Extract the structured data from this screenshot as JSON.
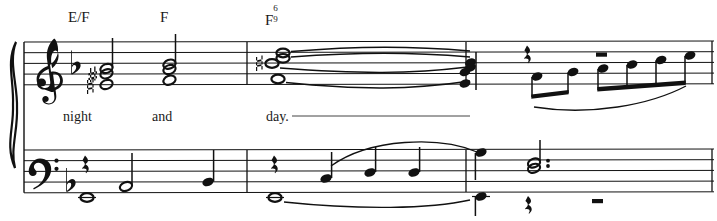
{
  "page": {
    "width": 717,
    "height": 221,
    "background_color": "#ffffff",
    "ink_color": "#111111"
  },
  "score": {
    "system": "grand-staff",
    "instrument": "piano with vocal line",
    "key_signature": "1 flat (F major / D minor)",
    "staves": [
      {
        "name": "treble",
        "clef": "treble-clef",
        "top": 42,
        "line_gap": 10.7
      },
      {
        "name": "bass",
        "clef": "bass-clef",
        "top": 150,
        "line_gap": 10.7
      }
    ],
    "barlines": [
      247,
      466,
      712
    ],
    "measures": 3
  },
  "chords": [
    {
      "root": "E",
      "bass": "F",
      "label": "E/F",
      "x": 68,
      "y": 10
    },
    {
      "root": "F",
      "bass": "",
      "label": "F",
      "x": 160,
      "y": 10
    },
    {
      "root": "F",
      "bass": "",
      "label": "F",
      "extension_top": "6",
      "extension_bottom": "9",
      "x": 265,
      "y": 10
    }
  ],
  "lyrics": [
    {
      "text": "night",
      "x": 63,
      "y": 110,
      "extender": false
    },
    {
      "text": "and",
      "x": 152,
      "y": 110,
      "extender": false
    },
    {
      "text": "day.",
      "x": 266,
      "y": 110,
      "extender": true,
      "extender_to": 470
    }
  ],
  "notation": {
    "treble": {
      "measure_1": {
        "description": "half-note chord with sharp and natural accidentals, stem up",
        "noteheads": [
          "half",
          "half",
          "half"
        ],
        "accidentals": [
          "sharp",
          "natural"
        ]
      },
      "measure_2": {
        "description": "half-note chord, stem up",
        "noteheads": [
          "half",
          "half",
          "half"
        ]
      },
      "measure_3": {
        "description": "whole-note chord with natural accidental, tied across the barline to quarter-note chord",
        "noteheads": [
          "whole",
          "whole",
          "whole",
          "whole"
        ],
        "accidentals": [
          "natural"
        ],
        "ties": 4
      },
      "measure_3b": {
        "description": "quarter rest, then two beamed eighth notes and four beamed eighth notes ascending under a slur, whole rest above",
        "rests": [
          "quarter-rest",
          "whole-rest"
        ],
        "beam_groups": [
          2,
          4
        ],
        "slur": true
      }
    },
    "bass": {
      "measure_1": {
        "description": "quarter rest, whole note below staff, half note, quarter note",
        "events": [
          "quarter-rest",
          "whole",
          "half",
          "quarter"
        ]
      },
      "measure_2": {
        "description": "quarter rest, tied whole note, three ascending quarter notes under a slur",
        "events": [
          "quarter-rest",
          "whole-tied",
          "quarter",
          "quarter",
          "quarter"
        ],
        "slur": true
      },
      "measure_3": {
        "description": "dotted half-note chord over quarter rest and whole rest",
        "events": [
          "dotted-half-chord",
          "quarter-rest",
          "whole-rest"
        ]
      }
    }
  }
}
